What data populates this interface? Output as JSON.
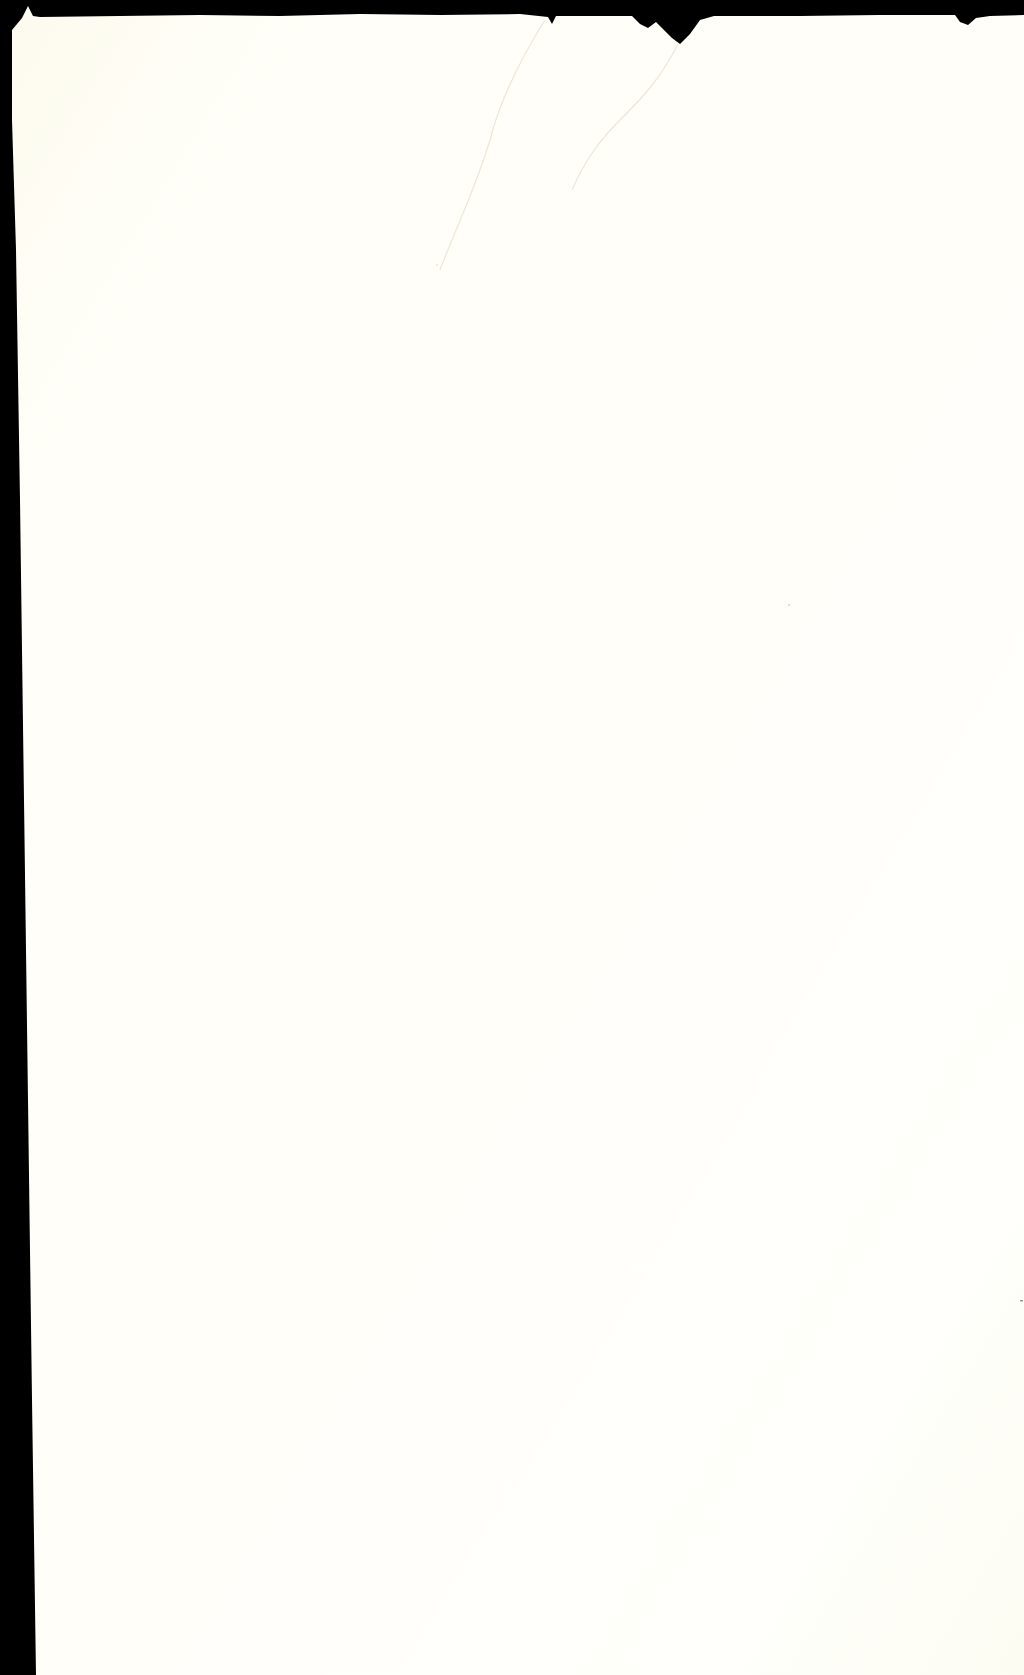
{
  "document": {
    "type": "scanned-blank-page",
    "text_content": [],
    "colors": {
      "background_scan_bed": "#000000",
      "paper": "#fffef6",
      "paper_edge_tint": "#fdfbee",
      "crease": "#e6e3cf"
    },
    "features": {
      "top_border": "torn paper edge against black scanner bed",
      "left_border": "black strip widening toward bottom",
      "creases": 2
    }
  }
}
